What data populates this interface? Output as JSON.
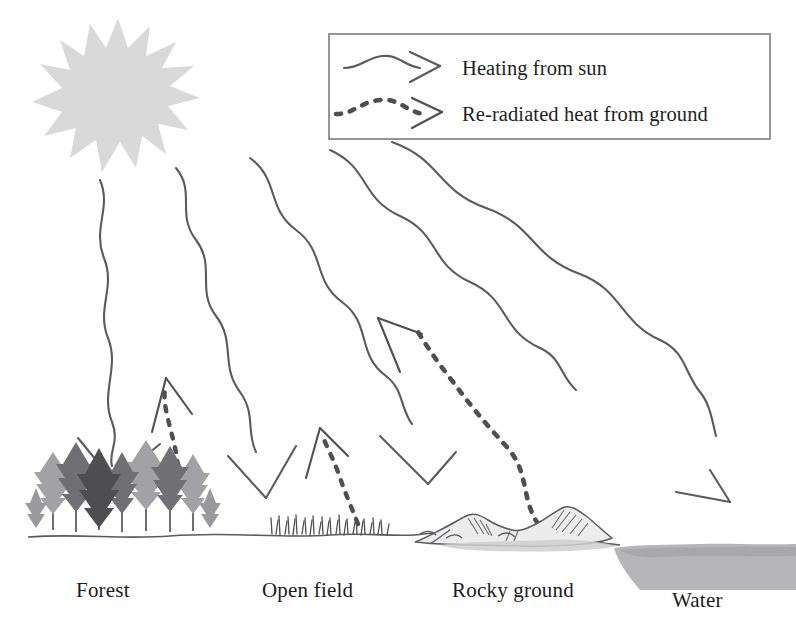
{
  "figure": {
    "kind": "science-diagram",
    "background_color": "#ffffff",
    "ink_color": "#5a5a5f",
    "text_color": "#1b1b1b"
  },
  "legend": {
    "box": {
      "border_color": "#8a8a8a",
      "fill": "#ffffff"
    },
    "entries": [
      {
        "id": "heating-from-sun",
        "label": "Heating from sun",
        "line_style": "solid",
        "sample_icon": "wavy-arrow-solid-icon",
        "color": "#5a5a5f"
      },
      {
        "id": "re-radiated-heat",
        "label": "Re-radiated heat from ground",
        "line_style": "dashed",
        "sample_icon": "wavy-arrow-dashed-icon",
        "color": "#4e4e53"
      }
    ]
  },
  "sun": {
    "icon": "sun-icon",
    "fill_color": "#d9d9d9",
    "center_x": 118,
    "center_y": 92,
    "ray_count": 16
  },
  "terrain_labels": [
    {
      "id": "forest",
      "text": "Forest",
      "x": 76,
      "y": 578
    },
    {
      "id": "open-field",
      "text": "Open field",
      "x": 262,
      "y": 578
    },
    {
      "id": "rocky-ground",
      "text": "Rocky ground",
      "x": 452,
      "y": 578
    },
    {
      "id": "water",
      "text": "Water",
      "x": 672,
      "y": 588
    }
  ],
  "terrain_features": [
    {
      "id": "forest",
      "icon": "conifer-trees-icon",
      "fill_color": "#8d8d90"
    },
    {
      "id": "open-field",
      "icon": "grass-tufts-icon",
      "fill_color": "#5a5a5f"
    },
    {
      "id": "rocky-ground",
      "icon": "rocks-icon",
      "fill_color": "#6d6d72"
    },
    {
      "id": "water",
      "icon": "water-body-icon",
      "fill_color": "#b6b6b8"
    }
  ],
  "incoming_rays": {
    "count": 5,
    "style": "solid",
    "description": "Wavy solid arrows from sun to forest, open field, rocky ground and water"
  },
  "reradiated_arrows": {
    "count": 3,
    "style": "dashed",
    "description": "Dashed wavy arrows rising from forest, open field and rocky ground"
  }
}
